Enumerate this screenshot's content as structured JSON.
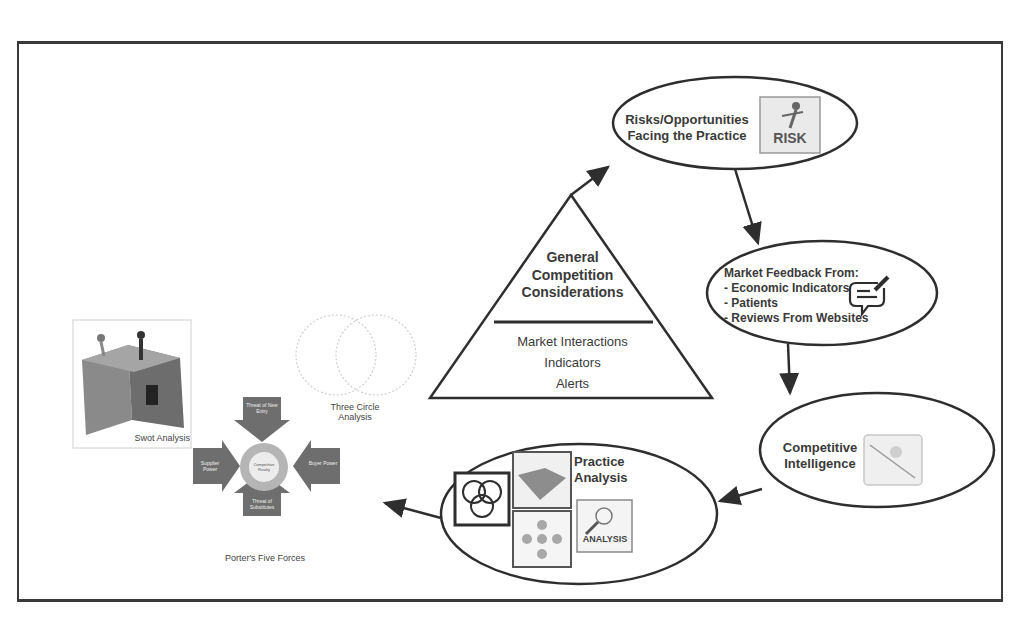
{
  "diagram": {
    "pyramid": {
      "top_lines": [
        "General",
        "Competition",
        "Considerations"
      ],
      "bottom_lines": [
        "Market Interactions",
        "Indicators",
        "Alerts"
      ]
    },
    "nodes": {
      "risks": {
        "lines": [
          "Risks/Opportunities",
          "Facing the Practice"
        ],
        "icon": "risk-icon",
        "icon_text": "RISK"
      },
      "feedback": {
        "title": "Market Feedback From:",
        "items": [
          "- Economic Indicators",
          "- Patients",
          "- Reviews From Websites"
        ],
        "icon": "chat-edit-icon"
      },
      "intelligence": {
        "lines": [
          "Competitive",
          "Intelligence"
        ],
        "icon": "puzzle-figure-icon"
      },
      "practice": {
        "lines": [
          "Practice",
          "Analysis"
        ],
        "icon_text": "ANALYSIS"
      }
    },
    "tools": {
      "swot": {
        "caption": "Swot Analysis"
      },
      "three_circle": {
        "lines": [
          "Three Circle",
          "Analysis"
        ]
      },
      "porter": {
        "caption": "Porter's Five Forces",
        "center": "Competitive Rivalry",
        "top": "Threat of New Entry",
        "left": "Supplier Power",
        "right": "Buyer Power",
        "bottom": "Threat of Substitutes"
      }
    },
    "colors": {
      "stroke": "#2e2e2e",
      "porter_arrow": "#6e6e6e",
      "frame": "#3a3a3a"
    }
  }
}
